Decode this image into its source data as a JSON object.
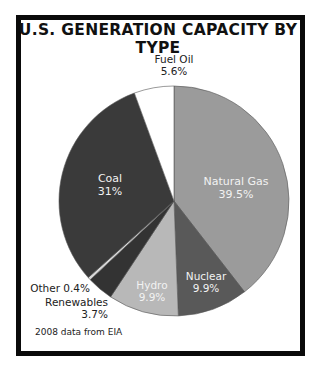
{
  "chart_data": {
    "type": "pie",
    "title": "U.S. GENERATION CAPACITY BY TYPE",
    "source_note": "2008 data from EIA",
    "start_angle_deg": 0,
    "direction": "clockwise",
    "slices": [
      {
        "label": "Natural Gas",
        "value": 39.5,
        "value_label": "39.5%",
        "color": "#9b9b9b"
      },
      {
        "label": "Nuclear",
        "value": 9.9,
        "value_label": "9.9%",
        "color": "#595959"
      },
      {
        "label": "Hydro",
        "value": 9.9,
        "value_label": "9.9%",
        "color": "#b8b8b8"
      },
      {
        "label": "Renewables",
        "value": 3.7,
        "value_label": "3.7%",
        "color": "#333333"
      },
      {
        "label": "Other",
        "value": 0.4,
        "value_label": "0.4%",
        "color": "#d9d9d9"
      },
      {
        "label": "Coal",
        "value": 31,
        "value_label": "31%",
        "color": "#3a3a3a"
      },
      {
        "label": "Fuel Oil",
        "value": 5.6,
        "value_label": "5.6%",
        "color": "#ffffff"
      }
    ]
  },
  "labels": {
    "natural_gas": {
      "name": "Natural Gas",
      "pct": "39.5%"
    },
    "coal": {
      "name": "Coal",
      "pct": "31%"
    },
    "nuclear": {
      "name": "Nuclear",
      "pct": "9.9%"
    },
    "hydro": {
      "name": "Hydro",
      "pct": "9.9%"
    },
    "fuel_oil": {
      "name": "Fuel Oil",
      "pct": "5.6%"
    },
    "other": "Other 0.4%",
    "renewables": "Renewables 3.7%"
  }
}
